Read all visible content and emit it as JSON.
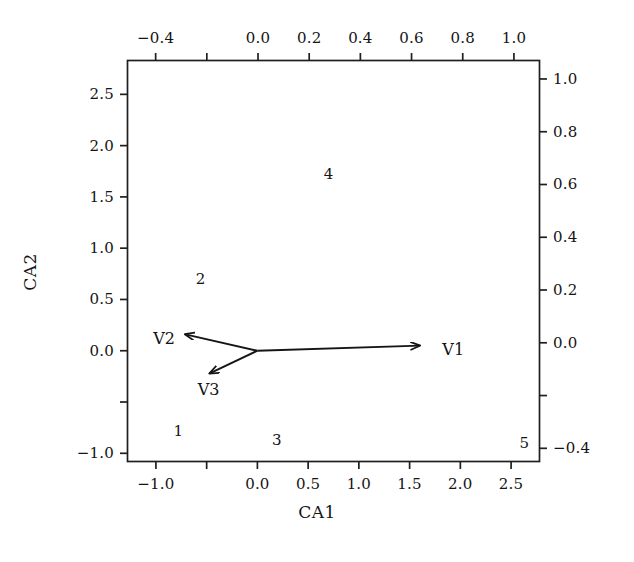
{
  "chart_data": {
    "type": "scatter",
    "title": "",
    "subtitle": "",
    "xlabel": "CA1",
    "ylabel": "CA2",
    "grid": false,
    "legend": "none",
    "axes": {
      "bottom": {
        "name": "CA1",
        "range": [
          -1.28,
          2.78
        ],
        "ticks": [
          -1.0,
          -0.5,
          0.0,
          0.5,
          1.0,
          1.5,
          2.0,
          2.5
        ],
        "tick_labels": [
          "-1.0",
          "",
          "0.0",
          "0.5",
          "1.0",
          "1.5",
          "2.0",
          "2.5"
        ]
      },
      "left": {
        "name": "CA2",
        "range": [
          -1.08,
          2.83
        ],
        "ticks": [
          -1.0,
          -0.5,
          0.0,
          0.5,
          1.0,
          1.5,
          2.0,
          2.5
        ],
        "tick_labels": [
          "-1.0",
          "",
          "0.0",
          "0.5",
          "1.0",
          "1.5",
          "2.0",
          "2.5"
        ]
      },
      "top": {
        "name": "",
        "range": [
          -0.51,
          1.1
        ],
        "ticks": [
          -0.4,
          -0.2,
          0.0,
          0.2,
          0.4,
          0.6,
          0.8,
          1.0
        ],
        "tick_labels": [
          "−0.4",
          "",
          "0.0",
          "0.2",
          "0.4",
          "0.6",
          "0.8",
          "1.0"
        ]
      },
      "right": {
        "name": "",
        "range": [
          -0.45,
          1.07
        ],
        "ticks": [
          -0.4,
          -0.2,
          0.0,
          0.2,
          0.4,
          0.6,
          0.8,
          1.0
        ],
        "tick_labels": [
          "−0.4",
          "",
          "0.0",
          "0.2",
          "0.4",
          "0.6",
          "0.8",
          "1.0"
        ]
      }
    },
    "points": [
      {
        "label": "1",
        "x": -0.78,
        "y": -0.78
      },
      {
        "label": "2",
        "x": -0.56,
        "y": 0.7
      },
      {
        "label": "3",
        "x": 0.19,
        "y": -0.87
      },
      {
        "label": "4",
        "x": 0.7,
        "y": 1.72
      },
      {
        "label": "5",
        "x": 2.63,
        "y": -0.9
      }
    ],
    "vectors": [
      {
        "label": "V1",
        "x0": 0.0,
        "y0": 0.0,
        "x1": 1.6,
        "y1": 0.05,
        "label_x": 1.93,
        "label_y": 0.02
      },
      {
        "label": "V2",
        "x0": 0.0,
        "y0": 0.0,
        "x1": -0.71,
        "y1": 0.16,
        "label_x": -0.92,
        "label_y": 0.12
      },
      {
        "label": "V3",
        "x0": 0.0,
        "y0": 0.0,
        "x1": -0.47,
        "y1": -0.22,
        "label_x": -0.48,
        "label_y": -0.37
      }
    ]
  },
  "figure": {
    "frame_color": "#1f1f1f",
    "data_color": "#151515"
  }
}
